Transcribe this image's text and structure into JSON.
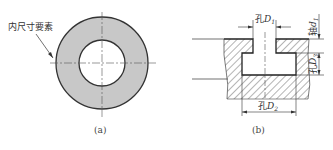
{
  "figure_a": {
    "label": "内尺寸要素",
    "caption": "(a)",
    "ring_fill": "#c8c8c8",
    "outline_color": "#333333"
  },
  "figure_b": {
    "caption": "(b)",
    "dimensions": {
      "top_opening": {
        "prefix": "孔",
        "symbol": "D",
        "subscript": "1"
      },
      "shaft_height": {
        "prefix": "轴",
        "symbol": "d",
        "subscript": "1"
      },
      "cavity_height": {
        "prefix": "孔",
        "symbol": "D",
        "subscript": "3"
      },
      "cavity_width": {
        "prefix": "孔",
        "symbol": "D",
        "subscript": "2"
      }
    }
  }
}
